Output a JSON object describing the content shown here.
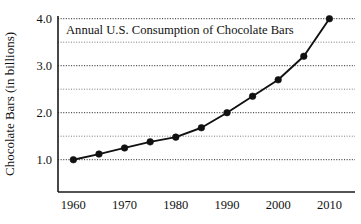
{
  "chart_data": {
    "type": "line",
    "title": "Annual U.S. Consumption of Chocolate Bars",
    "xlabel": "",
    "ylabel": "Chocolate Bars (in billions)",
    "x": [
      1960,
      1965,
      1970,
      1975,
      1980,
      1985,
      1990,
      1995,
      2000,
      2005,
      2010
    ],
    "values": [
      1.0,
      1.12,
      1.25,
      1.38,
      1.48,
      1.68,
      2.0,
      2.35,
      2.7,
      3.2,
      4.0
    ],
    "series": [
      {
        "name": "Chocolate Bars (in billions)",
        "values": [
          1.0,
          1.12,
          1.25,
          1.38,
          1.48,
          1.68,
          2.0,
          2.35,
          2.7,
          3.2,
          4.0
        ]
      }
    ],
    "xlim": [
      1957,
      2015
    ],
    "ylim": [
      0.5,
      4.0
    ],
    "x_tick_labels": [
      "1960",
      "1970",
      "1980",
      "1990",
      "2000",
      "2010"
    ],
    "x_tick_values": [
      1960,
      1970,
      1980,
      1990,
      2000,
      2010
    ],
    "y_tick_labels": [
      "1.0",
      "2.0",
      "3.0",
      "4.0"
    ],
    "y_tick_values": [
      1.0,
      2.0,
      3.0,
      4.0
    ],
    "y_gridline_values": [
      1.0,
      1.5,
      2.0,
      2.5,
      3.0,
      3.5,
      4.0
    ],
    "grid": "horizontal-dotted",
    "legend": "none",
    "marker": "filled-circle",
    "line_color": "#111111",
    "marker_color": "#111111",
    "grid_color": "#2b2b2b",
    "axis_color": "#1a1a1a",
    "background_color": "#ffffff"
  }
}
